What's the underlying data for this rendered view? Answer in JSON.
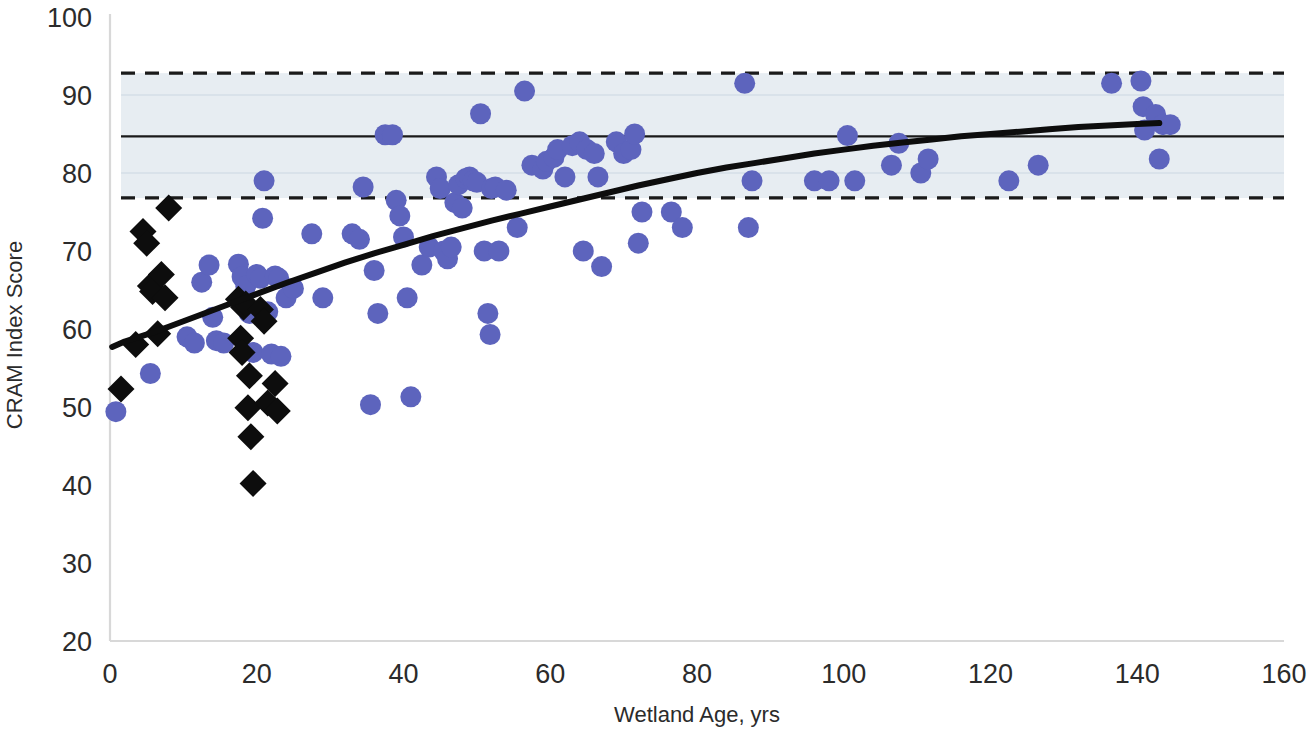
{
  "chart_data": {
    "type": "scatter",
    "title": "",
    "subtitle": "",
    "xlabel": "Wetland Age, yrs",
    "ylabel": "CRAM Index Score",
    "xlim": [
      0,
      160
    ],
    "ylim": [
      20,
      100
    ],
    "xticks": [
      0,
      20,
      40,
      60,
      80,
      100,
      120,
      140,
      160
    ],
    "yticks": [
      20,
      30,
      40,
      50,
      60,
      70,
      80,
      90,
      100
    ],
    "grid": "faint horizontal gridlines at 80 and 90 inside shaded band only",
    "legend": "none",
    "colors": {
      "circle_series": "#5d64bd",
      "diamond_series": "#0d0d0d",
      "fit_curve": "#0d0d0d",
      "reference_line": "#1a1a1a",
      "band_fill": "#e7edf2",
      "dashed_line": "#1a1a1a",
      "axis": "#d8d8d8",
      "text": "#2b2b2b"
    },
    "reference_band": {
      "label": "reference wetland range",
      "upper_dashed": 92.8,
      "mean_solid": 84.7,
      "lower_dashed": 76.8,
      "x_start": 1.5,
      "x_end": 160
    },
    "fit_curve": {
      "name": "logarithmic fit",
      "points": [
        [
          0.3,
          57.7
        ],
        [
          2,
          58.4
        ],
        [
          4,
          59.0
        ],
        [
          6,
          59.6
        ],
        [
          8,
          60.3
        ],
        [
          10,
          61.0
        ],
        [
          12,
          61.7
        ],
        [
          14,
          62.4
        ],
        [
          16,
          63.1
        ],
        [
          18,
          63.8
        ],
        [
          20,
          64.5
        ],
        [
          24,
          65.9
        ],
        [
          28,
          67.2
        ],
        [
          32,
          68.5
        ],
        [
          36,
          69.7
        ],
        [
          40,
          70.8
        ],
        [
          44,
          71.9
        ],
        [
          48,
          72.9
        ],
        [
          52,
          73.9
        ],
        [
          56,
          74.8
        ],
        [
          60,
          75.7
        ],
        [
          64,
          76.6
        ],
        [
          68,
          77.5
        ],
        [
          72,
          78.4
        ],
        [
          76,
          79.2
        ],
        [
          80,
          80.0
        ],
        [
          84,
          80.7
        ],
        [
          88,
          81.3
        ],
        [
          92,
          81.9
        ],
        [
          96,
          82.5
        ],
        [
          100,
          83.0
        ],
        [
          104,
          83.5
        ],
        [
          108,
          83.9
        ],
        [
          112,
          84.3
        ],
        [
          116,
          84.7
        ],
        [
          120,
          85.0
        ],
        [
          124,
          85.3
        ],
        [
          128,
          85.6
        ],
        [
          132,
          85.9
        ],
        [
          136,
          86.1
        ],
        [
          140,
          86.3
        ],
        [
          143,
          86.4
        ]
      ]
    },
    "series": [
      {
        "name": "restored / created wetlands",
        "marker": "circle",
        "color": "#5d64bd",
        "points": [
          [
            0.8,
            49.4
          ],
          [
            5.5,
            54.3
          ],
          [
            10.5,
            59.0
          ],
          [
            11.5,
            58.2
          ],
          [
            12.5,
            66.0
          ],
          [
            13.5,
            68.2
          ],
          [
            14.0,
            61.5
          ],
          [
            14.5,
            58.5
          ],
          [
            15.5,
            58.2
          ],
          [
            17.5,
            68.3
          ],
          [
            18.0,
            66.7
          ],
          [
            18.5,
            65.5
          ],
          [
            19.0,
            62.0
          ],
          [
            19.5,
            57.0
          ],
          [
            20.0,
            67.0
          ],
          [
            20.5,
            66.5
          ],
          [
            20.8,
            74.2
          ],
          [
            21.0,
            79.0
          ],
          [
            21.5,
            62.2
          ],
          [
            22.0,
            56.8
          ],
          [
            22.5,
            66.8
          ],
          [
            23.0,
            66.5
          ],
          [
            23.3,
            56.5
          ],
          [
            24.0,
            64.0
          ],
          [
            25.0,
            65.2
          ],
          [
            27.5,
            72.2
          ],
          [
            29.0,
            64.0
          ],
          [
            33.0,
            72.2
          ],
          [
            34.0,
            71.5
          ],
          [
            34.5,
            78.2
          ],
          [
            35.5,
            50.3
          ],
          [
            36.0,
            67.5
          ],
          [
            36.5,
            62.0
          ],
          [
            37.5,
            84.9
          ],
          [
            38.5,
            84.9
          ],
          [
            39.0,
            76.5
          ],
          [
            39.5,
            74.5
          ],
          [
            40.0,
            71.8
          ],
          [
            40.5,
            64.0
          ],
          [
            41.0,
            51.3
          ],
          [
            42.5,
            68.2
          ],
          [
            43.5,
            70.5
          ],
          [
            44.5,
            79.5
          ],
          [
            45.0,
            78.0
          ],
          [
            45.5,
            70.0
          ],
          [
            46.0,
            69.0
          ],
          [
            46.5,
            70.5
          ],
          [
            47.0,
            76.2
          ],
          [
            47.5,
            78.5
          ],
          [
            48.0,
            75.5
          ],
          [
            48.5,
            79.3
          ],
          [
            49.0,
            79.5
          ],
          [
            49.5,
            79.0
          ],
          [
            50.0,
            78.8
          ],
          [
            50.5,
            87.6
          ],
          [
            51.0,
            70.0
          ],
          [
            51.5,
            62.0
          ],
          [
            51.8,
            59.3
          ],
          [
            52.0,
            78.0
          ],
          [
            52.5,
            78.2
          ],
          [
            53.0,
            70.0
          ],
          [
            54.0,
            77.8
          ],
          [
            55.5,
            73.0
          ],
          [
            56.5,
            90.5
          ],
          [
            57.5,
            81.0
          ],
          [
            59.0,
            80.5
          ],
          [
            59.5,
            81.5
          ],
          [
            60.5,
            82.0
          ],
          [
            61.0,
            83.0
          ],
          [
            62.0,
            79.5
          ],
          [
            63.0,
            83.5
          ],
          [
            64.0,
            84.0
          ],
          [
            64.5,
            70.0
          ],
          [
            65.0,
            83.0
          ],
          [
            66.0,
            82.5
          ],
          [
            66.5,
            79.5
          ],
          [
            67.0,
            68.0
          ],
          [
            69.0,
            84.0
          ],
          [
            70.0,
            82.5
          ],
          [
            71.0,
            83.0
          ],
          [
            71.5,
            85.0
          ],
          [
            72.0,
            71.0
          ],
          [
            72.5,
            75.0
          ],
          [
            76.5,
            75.0
          ],
          [
            78.0,
            73.0
          ],
          [
            86.5,
            91.5
          ],
          [
            87.0,
            73.0
          ],
          [
            87.5,
            79.0
          ],
          [
            96.0,
            79.0
          ],
          [
            98.0,
            79.0
          ],
          [
            100.5,
            84.8
          ],
          [
            101.5,
            79.0
          ],
          [
            106.5,
            81.0
          ],
          [
            107.5,
            83.8
          ],
          [
            110.5,
            80.0
          ],
          [
            111.5,
            81.8
          ],
          [
            122.5,
            79.0
          ],
          [
            126.5,
            81.0
          ],
          [
            136.5,
            91.5
          ],
          [
            140.5,
            91.8
          ],
          [
            140.8,
            88.5
          ],
          [
            141.0,
            85.5
          ],
          [
            142.5,
            87.5
          ],
          [
            143.0,
            81.8
          ],
          [
            143.5,
            86.2
          ],
          [
            144.5,
            86.2
          ]
        ]
      },
      {
        "name": "reference wetlands",
        "marker": "diamond",
        "color": "#0d0d0d",
        "points": [
          [
            1.5,
            52.3
          ],
          [
            3.5,
            58.0
          ],
          [
            4.5,
            72.5
          ],
          [
            5.0,
            71.0
          ],
          [
            5.5,
            65.5
          ],
          [
            5.8,
            64.8
          ],
          [
            6.5,
            59.4
          ],
          [
            7.0,
            67.0
          ],
          [
            7.5,
            64.0
          ],
          [
            8.0,
            75.5
          ],
          [
            17.5,
            63.8
          ],
          [
            17.8,
            58.8
          ],
          [
            18.0,
            57.0
          ],
          [
            18.2,
            62.8
          ],
          [
            18.5,
            63.2
          ],
          [
            18.8,
            49.9
          ],
          [
            19.0,
            54.0
          ],
          [
            19.2,
            46.2
          ],
          [
            19.5,
            40.2
          ],
          [
            20.5,
            62.5
          ],
          [
            21.0,
            61.0
          ],
          [
            21.5,
            50.5
          ],
          [
            22.5,
            53.0
          ],
          [
            22.8,
            49.5
          ]
        ]
      }
    ]
  },
  "axis": {
    "x_tick_labels": [
      "0",
      "20",
      "40",
      "60",
      "80",
      "100",
      "120",
      "140",
      "160"
    ],
    "y_tick_labels": [
      "20",
      "30",
      "40",
      "50",
      "60",
      "70",
      "80",
      "90",
      "100"
    ],
    "x_title": "Wetland Age, yrs",
    "y_title": "CRAM Index Score"
  }
}
